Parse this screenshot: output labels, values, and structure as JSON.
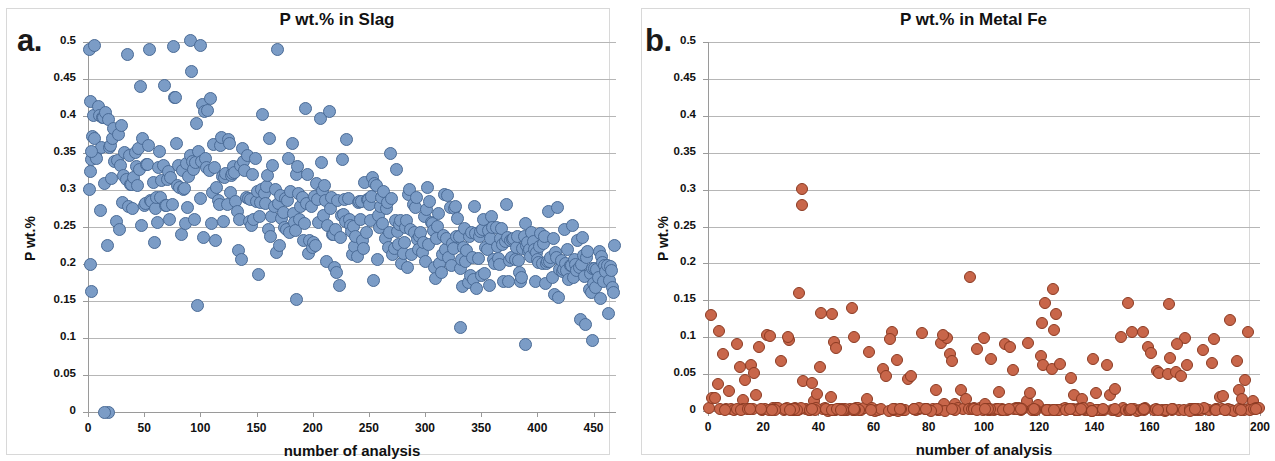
{
  "figure": {
    "panels": [
      {
        "letter": "a.",
        "title": "P wt.% in Slag",
        "xlabel": "number of analysis",
        "ylabel": "P wt.%",
        "marker_color": "#7b9cc6",
        "marker_edge": "#4a6b96"
      },
      {
        "letter": "b.",
        "title": "P wt.% in Metal Fe",
        "xlabel": "number of analysis",
        "ylabel": "P wt.%",
        "marker_color": "#c8664a",
        "marker_edge": "#8b3a22"
      }
    ]
  },
  "chart_data": [
    {
      "type": "scatter",
      "panel": "a",
      "title": "P wt.% in Slag",
      "xlabel": "number of analysis",
      "ylabel": "P wt.%",
      "xlim": [
        0,
        470
      ],
      "ylim": [
        0,
        0.5
      ],
      "xticks": [
        0,
        50,
        100,
        150,
        200,
        250,
        300,
        350,
        400,
        450
      ],
      "yticks": [
        0,
        0.05,
        0.1,
        0.15,
        0.2,
        0.25,
        0.3,
        0.35,
        0.4,
        0.45,
        0.5
      ],
      "ytick_labels": [
        "0",
        "0.05",
        "0.1",
        "0.15",
        "0.2",
        "0.25",
        "0.3",
        "0.35",
        "0.4",
        "0.45",
        "0.5"
      ],
      "xtick_labels": [
        "0",
        "50",
        "100",
        "150",
        "200",
        "250",
        "300",
        "350",
        "400",
        "450"
      ],
      "grid": true,
      "legend": "none",
      "n_points": 470,
      "description": "Downward sloping dense cloud of blue points; P wt.% falls from ~0.33 mean near analysis 0 to ~0.19 mean near analysis 470; scattered high outliers up to 0.50 in first third; a few low outliers near 0.10-0.15 and two points at 0 near analysis 18.",
      "trend": {
        "intercept": 0.335,
        "slope": -0.00032,
        "spread_start": 0.065,
        "spread_end": 0.035
      },
      "outliers": [
        {
          "x": 2,
          "y": 0.2
        },
        {
          "x": 3,
          "y": 0.163
        },
        {
          "x": 18,
          "y": 0.0
        },
        {
          "x": 15,
          "y": 0.0
        },
        {
          "x": 186,
          "y": 0.152
        },
        {
          "x": 332,
          "y": 0.114
        },
        {
          "x": 389,
          "y": 0.091
        },
        {
          "x": 449,
          "y": 0.097
        },
        {
          "x": 1,
          "y": 0.49
        },
        {
          "x": 6,
          "y": 0.495
        },
        {
          "x": 91,
          "y": 0.502
        },
        {
          "x": 100,
          "y": 0.495
        },
        {
          "x": 2,
          "y": 0.325
        },
        {
          "x": 3,
          "y": 0.352
        }
      ]
    },
    {
      "type": "scatter",
      "panel": "b",
      "title": "P wt.% in Metal Fe",
      "xlabel": "number of analysis",
      "ylabel": "P wt.%",
      "xlim": [
        0,
        200
      ],
      "ylim": [
        0,
        0.5
      ],
      "xticks": [
        0,
        20,
        40,
        60,
        80,
        100,
        120,
        140,
        160,
        180,
        200
      ],
      "yticks": [
        0,
        0.05,
        0.1,
        0.15,
        0.2,
        0.25,
        0.3,
        0.35,
        0.4,
        0.45,
        0.5
      ],
      "ytick_labels": [
        "0",
        "0.05",
        "0.1",
        "0.15",
        "0.2",
        "0.25",
        "0.3",
        "0.35",
        "0.4",
        "0.45",
        "0.5"
      ],
      "xtick_labels": [
        "0",
        "20",
        "40",
        "60",
        "80",
        "100",
        "120",
        "140",
        "160",
        "180",
        "200"
      ],
      "grid": true,
      "legend": "none",
      "n_points": 200,
      "description": "Orange points, majority pinned at 0 forming a dense band along the x-axis; sparse values scattered between 0.01 and 0.17; two extreme outliers near analysis 34 at 0.30 and 0.28, one at analysis 95 at 0.182.",
      "baseline_fraction": 0.55,
      "scatter_max": 0.17,
      "outliers": [
        {
          "x": 34,
          "y": 0.301
        },
        {
          "x": 34,
          "y": 0.279
        },
        {
          "x": 95,
          "y": 0.182
        },
        {
          "x": 33,
          "y": 0.16
        },
        {
          "x": 125,
          "y": 0.165
        },
        {
          "x": 122,
          "y": 0.146
        },
        {
          "x": 152,
          "y": 0.147
        },
        {
          "x": 167,
          "y": 0.145
        },
        {
          "x": 52,
          "y": 0.139
        },
        {
          "x": 41,
          "y": 0.133
        },
        {
          "x": 45,
          "y": 0.132
        },
        {
          "x": 126,
          "y": 0.132
        },
        {
          "x": 1,
          "y": 0.13
        },
        {
          "x": 189,
          "y": 0.123
        },
        {
          "x": 121,
          "y": 0.119
        },
        {
          "x": 4,
          "y": 0.108
        },
        {
          "x": 85,
          "y": 0.103
        },
        {
          "x": 29,
          "y": 0.1
        },
        {
          "x": 53,
          "y": 0.1
        },
        {
          "x": 100,
          "y": 0.099
        },
        {
          "x": 66,
          "y": 0.098
        },
        {
          "x": 173,
          "y": 0.099
        },
        {
          "x": 116,
          "y": 0.092
        },
        {
          "x": 170,
          "y": 0.091
        }
      ]
    }
  ]
}
